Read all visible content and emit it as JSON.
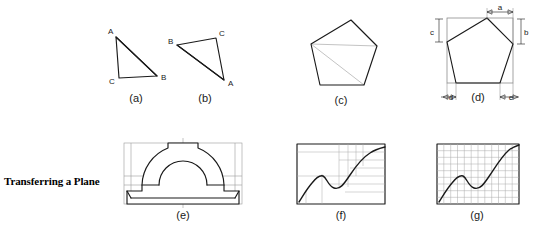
{
  "section": {
    "title": "Transferring a Plane"
  },
  "figures": [
    {
      "key": "a",
      "caption": "(a)",
      "cx": 136,
      "cy": 98
    },
    {
      "key": "b",
      "caption": "(b)",
      "cx": 205,
      "cy": 98
    },
    {
      "key": "c",
      "caption": "(c)",
      "cx": 341,
      "cy": 100
    },
    {
      "key": "d",
      "caption": "(d)",
      "cx": 477,
      "cy": 103
    },
    {
      "key": "e",
      "caption": "(e)",
      "cx": 183,
      "cy": 215
    },
    {
      "key": "f",
      "caption": "(f)",
      "cx": 341,
      "cy": 215
    },
    {
      "key": "g",
      "caption": "(g)",
      "cx": 477,
      "cy": 215
    }
  ],
  "triangle_a": {
    "caption": "(a)",
    "vertices": [
      {
        "label": "A",
        "x": 116,
        "y": 37,
        "lx": 108,
        "ly": 34
      },
      {
        "label": "C",
        "x": 119,
        "y": 78,
        "lx": 110,
        "ly": 82
      },
      {
        "label": "B",
        "x": 157,
        "y": 76,
        "lx": 161,
        "ly": 79
      }
    ]
  },
  "triangle_b": {
    "caption": "(b)",
    "vertices": [
      {
        "label": "B",
        "x": 177,
        "y": 45,
        "lx": 169,
        "ly": 43
      },
      {
        "label": "C",
        "x": 216,
        "y": 38,
        "lx": 219,
        "ly": 35
      },
      {
        "label": "A",
        "x": 224,
        "y": 80,
        "lx": 228,
        "ly": 84
      }
    ]
  },
  "pentagon_c": {
    "caption": "(c)",
    "vertices": [
      {
        "x": 311,
        "y": 44
      },
      {
        "x": 351,
        "y": 20
      },
      {
        "x": 377,
        "y": 46
      },
      {
        "x": 364,
        "y": 85
      },
      {
        "x": 320,
        "y": 85
      }
    ],
    "diagonals_from_vertex": 0,
    "diagonal_targets": [
      2,
      3
    ]
  },
  "pentagon_d": {
    "caption": "(d)",
    "vertices": [
      {
        "x": 447,
        "y": 42
      },
      {
        "x": 487,
        "y": 18
      },
      {
        "x": 513,
        "y": 44
      },
      {
        "x": 500,
        "y": 83
      },
      {
        "x": 456,
        "y": 83
      }
    ],
    "bounding_box": {
      "x": 447,
      "y": 18,
      "width": 66,
      "height": 65
    },
    "dimensions": [
      {
        "label": "a",
        "position": "top",
        "desc": "offset from left box edge to apex"
      },
      {
        "label": "b",
        "position": "right",
        "desc": "vertical drop to right vertex"
      },
      {
        "label": "c",
        "position": "left",
        "desc": "vertical drop to left vertex"
      },
      {
        "label": "d",
        "position": "bottom-left",
        "desc": "offset to bottom-left vertex"
      },
      {
        "label": "e",
        "position": "bottom-right",
        "desc": "offset to bottom-right vertex"
      }
    ]
  },
  "bracket_e": {
    "caption": "(e)",
    "bounding_box": {
      "x": 124,
      "y": 143,
      "width": 118,
      "height": 61
    },
    "description": "bearing block with semicircular arch and construction grid"
  },
  "curve_f": {
    "caption": "(f)",
    "bounding_box": {
      "x": 297,
      "y": 144,
      "width": 88,
      "height": 60
    },
    "grid_type": "irregular",
    "vertical_grid_x": [
      322,
      339,
      348,
      356,
      363
    ],
    "horizontal_grid_y": [
      156,
      165,
      173,
      181,
      189
    ],
    "description": "S-curve transferred using irregular offset lines"
  },
  "curve_g": {
    "caption": "(g)",
    "bounding_box": {
      "x": 437,
      "y": 144,
      "width": 82,
      "height": 60
    },
    "grid_type": "uniform",
    "grid_columns": 12,
    "grid_rows": 9,
    "description": "S-curve transferred using a uniform square grid"
  },
  "colors": {
    "object_line": "#1a1a1a",
    "construction_line": "#9a9a9a",
    "grid_line": "#8c8c8c",
    "background": "#ffffff",
    "text": "#000000"
  }
}
